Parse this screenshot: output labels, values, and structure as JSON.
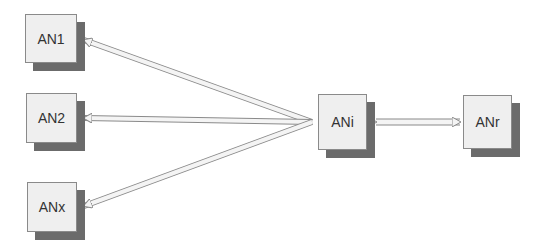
{
  "diagram": {
    "nodes": [
      {
        "id": "an1",
        "label": "AN1"
      },
      {
        "id": "an2",
        "label": "AN2"
      },
      {
        "id": "anx",
        "label": "ANx"
      },
      {
        "id": "ani",
        "label": "ANi"
      },
      {
        "id": "anr",
        "label": "ANr"
      }
    ],
    "edges": [
      {
        "from": "ani",
        "to": "an1",
        "style": "single-headed"
      },
      {
        "from": "ani",
        "to": "an2",
        "style": "single-headed"
      },
      {
        "from": "ani",
        "to": "anx",
        "style": "single-headed"
      },
      {
        "from": "ani",
        "to": "anr",
        "style": "double-headed"
      }
    ],
    "colors": {
      "box_fill": "#efefef",
      "shadow": "#6b6b6b",
      "arrow_fill": "#f4f4f4",
      "arrow_stroke": "#8a8a8a"
    }
  }
}
